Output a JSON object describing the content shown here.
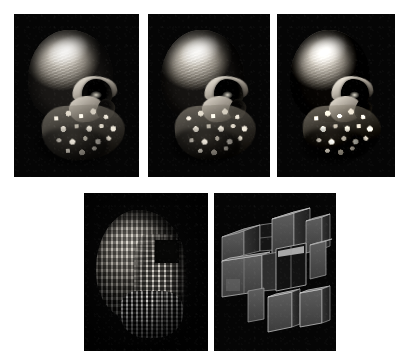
{
  "figure": {
    "title": "",
    "background_color": "#ffffff",
    "panel_background_color": "#050505",
    "rows": [
      {
        "row_name": "top-row-skull-renderings",
        "panels": [
          {
            "id": "panel-1",
            "name": "skull-full-resolution",
            "content": "volume-rendered human skull, lateral three-quarter view, smooth high-resolution isosurface",
            "detail_level": "full",
            "x": 14,
            "y": 14,
            "width": 125,
            "height": 163
          },
          {
            "id": "panel-2",
            "name": "skull-medium-resolution",
            "content": "volume-rendered human skull, lateral three-quarter view, slightly reduced resolution",
            "detail_level": "medium",
            "x": 148,
            "y": 14,
            "width": 122,
            "height": 163
          },
          {
            "id": "panel-3",
            "name": "skull-reduced-resolution",
            "content": "volume-rendered human skull, lateral three-quarter view, coarser surface detail",
            "detail_level": "reduced",
            "x": 277,
            "y": 14,
            "width": 118,
            "height": 163
          }
        ]
      },
      {
        "row_name": "bottom-row-coarse-representations",
        "panels": [
          {
            "id": "panel-4",
            "name": "skull-voxel-blocks",
            "content": "skull rendered as coarse rectangular voxel blocks",
            "detail_level": "voxel",
            "x": 84,
            "y": 193,
            "width": 124,
            "height": 158
          },
          {
            "id": "panel-5",
            "name": "skull-octree-bricks",
            "content": "skull volume reduced to a small set of large shaded boxes (octree bricks)",
            "detail_level": "brick",
            "x": 214,
            "y": 193,
            "width": 122,
            "height": 158
          }
        ]
      }
    ],
    "colors": {
      "page_background": "#ffffff",
      "panel_background": "#050505",
      "bone_highlight": "#f2f0ea",
      "bone_midtone": "#8b857b",
      "bone_shadow": "#1a1816",
      "brick_face_light": "#6a6a6a",
      "brick_face_mid": "#4a4a4a",
      "brick_face_dark": "#2a2a2a",
      "brick_edge": "#9a9a9a"
    }
  }
}
